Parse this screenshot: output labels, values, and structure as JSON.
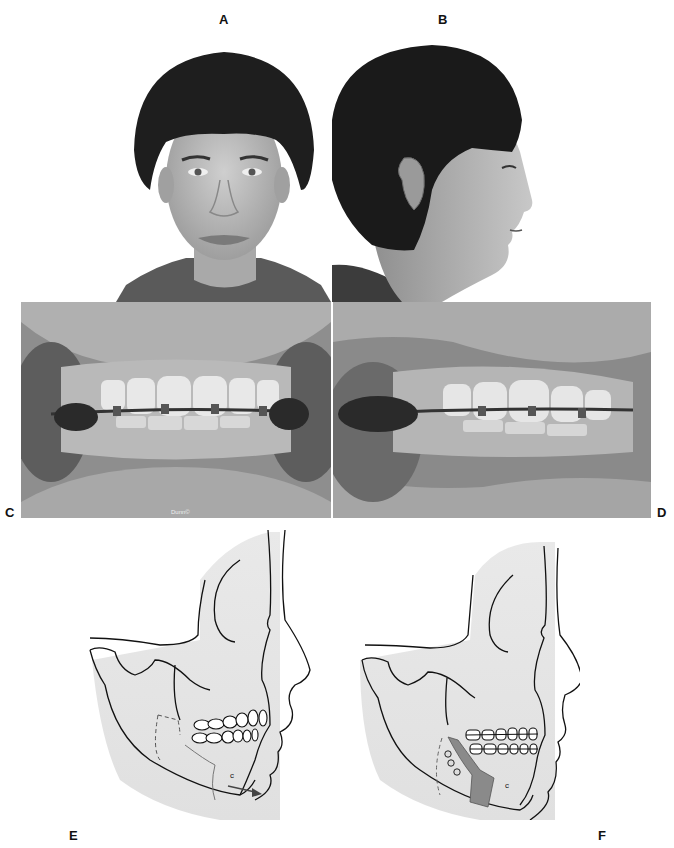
{
  "figure": {
    "panels": [
      {
        "id": "A",
        "label": "A",
        "description": "Frontal facial photograph of adolescent male, smiling"
      },
      {
        "id": "B",
        "label": "B",
        "description": "Right profile facial photograph of adolescent male"
      },
      {
        "id": "C",
        "label": "C",
        "description": "Frontal intraoral photograph with fixed orthodontic appliances"
      },
      {
        "id": "D",
        "label": "D",
        "description": "Oblique intraoral photograph with fixed orthodontic appliances"
      },
      {
        "id": "E",
        "label": "E",
        "description": "Lateral skull/profile diagram with planned mandibular osteotomy (dashed line) and advancement arrow"
      },
      {
        "id": "F",
        "label": "F",
        "description": "Lateral skull/profile diagram after mandibular advancement with bone graft and fixation screws"
      }
    ],
    "intraoral_watermark": "Dunn©"
  },
  "icons": {
    "advancement_arrow": "arrow-right-icon",
    "fixation_screw": "screw-icon"
  },
  "colors": {
    "diagram_shade": "#e4e4e4",
    "graft_fill": "#8a8a8a",
    "line": "#111111",
    "photo_bg": "#ffffff"
  }
}
